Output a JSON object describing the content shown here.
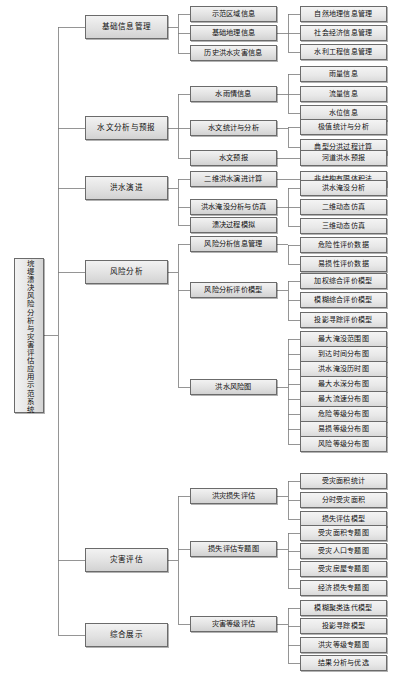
{
  "diagram": {
    "title": "垸堤溃决风险分析与灾害评估应用示范系统",
    "type": "tree-hierarchy",
    "orientation": "left-to-right",
    "line_color": "#7a7a7a",
    "node_border_color": "#6b6b6b",
    "node_fill_color": "#e4e4e4",
    "root": {
      "label": "垸堤溃决风险分析与灾害评估应用示范系统"
    },
    "level1": [
      {
        "label": "基础信息管理"
      },
      {
        "label": "水文分析与预报"
      },
      {
        "label": "洪水演进"
      },
      {
        "label": "风险分析"
      },
      {
        "label": "灾害评估"
      },
      {
        "label": "综合展示"
      }
    ],
    "level2": [
      {
        "label": "示范区域信息"
      },
      {
        "label": "基础地理信息"
      },
      {
        "label": "历史洪水灾害信息"
      },
      {
        "label": "水雨情信息"
      },
      {
        "label": "水文统计与分析"
      },
      {
        "label": "水文预报"
      },
      {
        "label": "二维洪水演进计算"
      },
      {
        "label": "洪水淹没分析与仿真"
      },
      {
        "label": "溃决过程模拟"
      },
      {
        "label": "风险分析信息管理"
      },
      {
        "label": "风险分析评价模型"
      },
      {
        "label": "洪水风险图"
      },
      {
        "label": "洪灾损失评估"
      },
      {
        "label": "损失评估专题图"
      },
      {
        "label": "灾害等级评估"
      }
    ],
    "level3": [
      {
        "label": "自然地理信息管理"
      },
      {
        "label": "社会经济信息管理"
      },
      {
        "label": "水利工程信息管理"
      },
      {
        "label": "雨量信息"
      },
      {
        "label": "流量信息"
      },
      {
        "label": "水位信息"
      },
      {
        "label": "极值统计与分析"
      },
      {
        "label": "典型分洪过程计算"
      },
      {
        "label": "河道洪水预报"
      },
      {
        "label": "非结构有限体积法"
      },
      {
        "label": "洪水淹没分析"
      },
      {
        "label": "二维动态仿真"
      },
      {
        "label": "三维动态仿真"
      },
      {
        "label": "危险性评价数据"
      },
      {
        "label": "易损性评价数据"
      },
      {
        "label": "加权综合评价模型"
      },
      {
        "label": "模糊综合评价模型"
      },
      {
        "label": "投影寻踪评价模型"
      },
      {
        "label": "最大淹没范围图"
      },
      {
        "label": "到达时间分布图"
      },
      {
        "label": "洪水淹没历时图"
      },
      {
        "label": "最大水深分布图"
      },
      {
        "label": "最大流速分布图"
      },
      {
        "label": "危险等级分布图"
      },
      {
        "label": "易损等级分布图"
      },
      {
        "label": "风险等级分布图"
      },
      {
        "label": "受灾面积统计"
      },
      {
        "label": "分时受灾面积"
      },
      {
        "label": "损失评估模型"
      },
      {
        "label": "受灾面积专题图"
      },
      {
        "label": "受灾人口专题图"
      },
      {
        "label": "受灾房屋专题图"
      },
      {
        "label": "经济损失专题图"
      },
      {
        "label": "模糊聚类迭代模型"
      },
      {
        "label": "投影寻踪模型"
      },
      {
        "label": "洪灾等级专题图"
      },
      {
        "label": "结果分析与优选"
      }
    ]
  }
}
